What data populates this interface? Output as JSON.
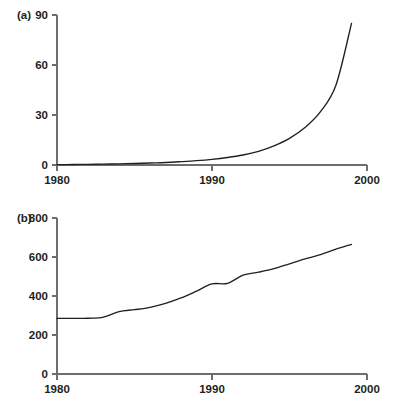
{
  "figure": {
    "background_color": "#ffffff",
    "line_color": "#231f20",
    "axis_color": "#6d6e71"
  },
  "panels": [
    {
      "label": "(a)",
      "yticks": [
        "0",
        "30",
        "60",
        "90"
      ],
      "xticks": [
        "1980",
        "1990",
        "2000"
      ]
    },
    {
      "label": "(b)",
      "yticks": [
        "0",
        "200",
        "400",
        "600",
        "800"
      ],
      "xticks": [
        "1980",
        "1990",
        "2000"
      ]
    }
  ],
  "chart_data": [
    {
      "type": "line",
      "title": "(a)",
      "xlabel": "",
      "ylabel": "",
      "xlim": [
        1980,
        2000
      ],
      "ylim": [
        0,
        90
      ],
      "xticks": [
        1980,
        1990,
        2000
      ],
      "yticks": [
        0,
        30,
        60,
        90
      ],
      "grid": false,
      "legend": "none",
      "series": [
        {
          "name": "(a) series",
          "x": [
            1980,
            1981,
            1982,
            1983,
            1984,
            1985,
            1986,
            1987,
            1988,
            1989,
            1990,
            1991,
            1992,
            1993,
            1994,
            1995,
            1996,
            1997,
            1998,
            1999
          ],
          "values": [
            0.2,
            0.3,
            0.4,
            0.5,
            0.7,
            0.9,
            1.2,
            1.5,
            2.0,
            2.6,
            3.4,
            4.5,
            6.0,
            8.2,
            11.5,
            16.0,
            22.5,
            32.0,
            48.0,
            85.0
          ]
        }
      ]
    },
    {
      "type": "line",
      "title": "(b)",
      "xlabel": "",
      "ylabel": "",
      "xlim": [
        1980,
        2000
      ],
      "ylim": [
        0,
        800
      ],
      "xticks": [
        1980,
        1990,
        2000
      ],
      "yticks": [
        0,
        200,
        400,
        600,
        800
      ],
      "grid": false,
      "legend": "none",
      "series": [
        {
          "name": "(b) series",
          "x": [
            1980,
            1981,
            1982,
            1983,
            1984,
            1985,
            1986,
            1987,
            1988,
            1989,
            1990,
            1991,
            1992,
            1993,
            1994,
            1995,
            1996,
            1997,
            1998,
            1999
          ],
          "values": [
            285,
            285,
            286,
            292,
            320,
            330,
            342,
            362,
            390,
            425,
            462,
            465,
            507,
            522,
            540,
            565,
            590,
            612,
            640,
            665
          ]
        }
      ]
    }
  ]
}
